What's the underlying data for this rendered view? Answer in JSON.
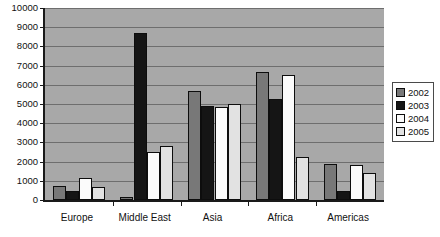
{
  "chart_data": {
    "type": "bar",
    "title": "",
    "xlabel": "",
    "ylabel": "",
    "ylim": [
      0,
      10000
    ],
    "yticks": [
      0,
      1000,
      2000,
      3000,
      4000,
      5000,
      6000,
      7000,
      8000,
      9000,
      10000
    ],
    "ytick_labels": [
      "0",
      "1000",
      "2000",
      "3000",
      "4000",
      "5000",
      "6000",
      "7000",
      "8000",
      "9000",
      "10000"
    ],
    "grid": true,
    "legend_position": "right",
    "categories": [
      "Europe",
      "Middle East",
      "Asia",
      "Africa",
      "Americas"
    ],
    "series": [
      {
        "name": "2002",
        "color": "#787878",
        "values": [
          750,
          180,
          5700,
          6670,
          1870
        ]
      },
      {
        "name": "2003",
        "color": "#151515",
        "values": [
          470,
          8680,
          4880,
          5280,
          470
        ]
      },
      {
        "name": "2004",
        "color": "#fbfbfb",
        "values": [
          1170,
          2500,
          4840,
          6530,
          1810
        ]
      },
      {
        "name": "2005",
        "color": "#e2e2e2",
        "values": [
          690,
          2820,
          5000,
          2230,
          1430
        ]
      }
    ]
  },
  "legend": {
    "items": [
      {
        "label": "2002",
        "color": "#787878"
      },
      {
        "label": "2003",
        "color": "#151515"
      },
      {
        "label": "2004",
        "color": "#fbfbfb"
      },
      {
        "label": "2005",
        "color": "#e2e2e2"
      }
    ]
  }
}
